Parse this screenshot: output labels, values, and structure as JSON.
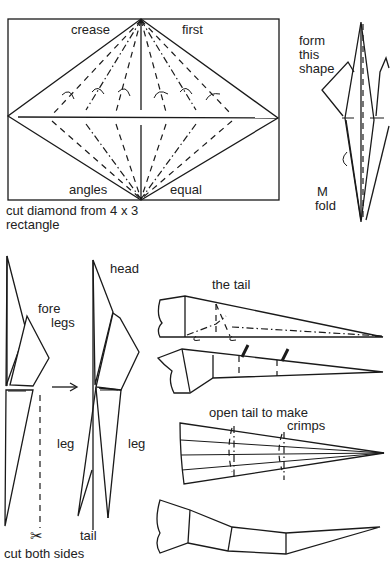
{
  "diagram": {
    "step1": {
      "labels": {
        "top_left": "crease",
        "top_right": "first",
        "bottom_left": "angles",
        "bottom_right": "equal"
      },
      "caption_line1": "cut diamond from 4 x 3",
      "caption_line2": "rectangle"
    },
    "step2": {
      "label_line1": "form",
      "label_line2": "this",
      "label_line3": "shape",
      "fold_line1": "M",
      "fold_line2": "fold"
    },
    "step3": {
      "fore_line1": "fore",
      "fore_line2": "legs",
      "head": "head",
      "leg_left": "leg",
      "leg_right": "leg",
      "tail": "tail",
      "cut_caption": "cut both sides",
      "scissors_glyph": "✂"
    },
    "step4": {
      "title": "the tail",
      "open_line1": "open tail to make",
      "open_line2": "crimps"
    }
  }
}
